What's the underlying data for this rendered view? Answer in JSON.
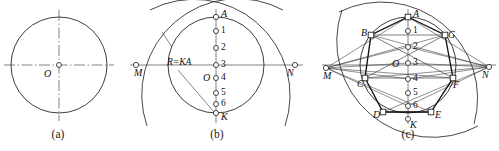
{
  "figure": {
    "width": 499,
    "height": 151,
    "background": "#ffffff",
    "stroke_color": "#1a1a1a",
    "center_line_color": "#555555",
    "marker_fill": "#ffffff",
    "thin_stroke": 0.7,
    "medium_stroke": 0.9,
    "heavy_stroke": 1.3
  },
  "captions": [
    {
      "key": "a",
      "text": "(a)",
      "x": 58,
      "y": 130
    },
    {
      "key": "b",
      "text": "(b)",
      "x": 217,
      "y": 130
    },
    {
      "key": "c",
      "text": "(c)",
      "x": 408,
      "y": 130
    }
  ],
  "panel_a": {
    "caption": "(a)",
    "circle": {
      "cx": 59,
      "cy": 65,
      "r": 48
    },
    "center_label": {
      "text": "O",
      "x": 48,
      "y": 72
    },
    "axes": {
      "horizontal": {
        "x1": 4,
        "y1": 65,
        "x2": 114,
        "y2": 65
      },
      "vertical": {
        "x1": 59,
        "y1": 10,
        "x2": 59,
        "y2": 120
      },
      "style": "dash-dot"
    },
    "center_marker": {
      "cx": 59,
      "cy": 65,
      "r": 2.6
    }
  },
  "panel_b": {
    "caption": "(b)",
    "circle": {
      "cx": 216,
      "cy": 65,
      "r": 48
    },
    "diameter_top": {
      "label": "A",
      "x": 216,
      "y": 17
    },
    "diameter_bottom": {
      "label": "K",
      "x": 216,
      "y": 113
    },
    "center_label": {
      "text": "O",
      "x": 205,
      "y": 76
    },
    "axis_horizontal": {
      "x1": 130,
      "y1": 65,
      "x2": 302,
      "y2": 65
    },
    "axis_vertical": {
      "x1": 216,
      "y1": 10,
      "x2": 216,
      "y2": 122
    },
    "point_M": {
      "label": "M",
      "x": 136,
      "y": 65
    },
    "point_N": {
      "label": "N",
      "x": 295,
      "y": 65
    },
    "radius_note": {
      "text": "R=KA",
      "x": 167,
      "y": 62
    },
    "arc_radius_note": "R = KA",
    "division_points": [
      {
        "label": "1",
        "x": 216,
        "y": 33
      },
      {
        "label": "2",
        "x": 216,
        "y": 49
      },
      {
        "label": "3",
        "x": 216,
        "y": 65
      },
      {
        "label": "4",
        "x": 216,
        "y": 81
      },
      {
        "label": "5",
        "x": 216,
        "y": 97
      },
      {
        "label": "6",
        "x": 216,
        "y": 105
      }
    ],
    "divisions_count": 7,
    "arcs": [
      {
        "from": "M",
        "through": "A",
        "description": "arc of radius KA centred at M"
      },
      {
        "from": "N",
        "through": "A",
        "description": "arc of radius KA centred at N"
      }
    ]
  },
  "panel_c": {
    "caption": "(c)",
    "circle": {
      "cx": 408,
      "cy": 65,
      "r": 48
    },
    "center_label": {
      "text": "O",
      "x": 393,
      "y": 69
    },
    "axis_horizontal": {
      "x1": 322,
      "y1": 65,
      "x2": 495,
      "y2": 65
    },
    "axis_vertical": {
      "x1": 408,
      "y1": 10,
      "x2": 408,
      "y2": 124
    },
    "point_M": {
      "label": "M",
      "x": 326,
      "y": 68
    },
    "point_N": {
      "label": "N",
      "x": 489,
      "y": 67
    },
    "point_K": {
      "label": "K",
      "x": 408,
      "y": 120
    },
    "vertices": [
      {
        "label": "A",
        "x": 408,
        "y": 17
      },
      {
        "label": "B",
        "x": 371,
        "y": 35
      },
      {
        "label": "G",
        "x": 445,
        "y": 35
      },
      {
        "label": "C",
        "x": 365,
        "y": 78
      },
      {
        "label": "F",
        "x": 453,
        "y": 78
      },
      {
        "label": "D",
        "x": 383,
        "y": 112
      },
      {
        "label": "E",
        "x": 431,
        "y": 112
      }
    ],
    "vertex_labels_order": [
      "A",
      "B",
      "G",
      "C",
      "F",
      "D",
      "E"
    ],
    "division_points": [
      {
        "label": "1",
        "x": 408,
        "y": 31
      },
      {
        "label": "2",
        "x": 408,
        "y": 47
      },
      {
        "label": "3",
        "x": 408,
        "y": 63
      },
      {
        "label": "4",
        "x": 408,
        "y": 79
      },
      {
        "label": "5",
        "x": 408,
        "y": 93
      },
      {
        "label": "6",
        "x": 408,
        "y": 106
      }
    ],
    "polygon": "heptagon ABGFEDC inscribed in the circle",
    "construction_rays": "rays from M and N through even division points meet the circle at the polygon vertices"
  }
}
